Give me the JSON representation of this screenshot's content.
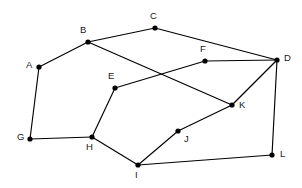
{
  "figure": {
    "kind": "undirected-graph-diagram",
    "background_color": "#ffffff",
    "edge_color": "#000000",
    "vertex_color": "#000000",
    "label_color": "#1a1a1a",
    "vertex_radius": 2.6,
    "edge_width": 1.15,
    "width": 302,
    "height": 188
  },
  "graph": {
    "vertex_count": 12,
    "edge_count": 15,
    "vertices": [
      {
        "id": "A",
        "label": "A",
        "x": 39,
        "y": 67,
        "label_x": 26,
        "label_y": 60
      },
      {
        "id": "B",
        "label": "B",
        "x": 88,
        "y": 42,
        "label_x": 80,
        "label_y": 25
      },
      {
        "id": "C",
        "label": "C",
        "x": 155,
        "y": 28,
        "label_x": 150,
        "label_y": 11
      },
      {
        "id": "D",
        "label": "D",
        "x": 277,
        "y": 60,
        "label_x": 284,
        "label_y": 53
      },
      {
        "id": "E",
        "label": "E",
        "x": 115,
        "y": 88,
        "label_x": 108,
        "label_y": 71
      },
      {
        "id": "F",
        "label": "F",
        "x": 205,
        "y": 61,
        "label_x": 200,
        "label_y": 44
      },
      {
        "id": "G",
        "label": "G",
        "x": 30,
        "y": 139,
        "label_x": 17,
        "label_y": 132
      },
      {
        "id": "H",
        "label": "H",
        "x": 92,
        "y": 137,
        "label_x": 86,
        "label_y": 142
      },
      {
        "id": "I",
        "label": "I",
        "x": 138,
        "y": 165,
        "label_x": 135,
        "label_y": 170
      },
      {
        "id": "J",
        "label": "J",
        "x": 178,
        "y": 131,
        "label_x": 184,
        "label_y": 134
      },
      {
        "id": "K",
        "label": "K",
        "x": 232,
        "y": 105,
        "label_x": 239,
        "label_y": 100
      },
      {
        "id": "L",
        "label": "L",
        "x": 272,
        "y": 155,
        "label_x": 280,
        "label_y": 149
      }
    ],
    "edges": [
      {
        "from": "A",
        "to": "B"
      },
      {
        "from": "A",
        "to": "G"
      },
      {
        "from": "B",
        "to": "C"
      },
      {
        "from": "B",
        "to": "K"
      },
      {
        "from": "C",
        "to": "D"
      },
      {
        "from": "D",
        "to": "F"
      },
      {
        "from": "D",
        "to": "K"
      },
      {
        "from": "D",
        "to": "L"
      },
      {
        "from": "E",
        "to": "F"
      },
      {
        "from": "E",
        "to": "H"
      },
      {
        "from": "G",
        "to": "H"
      },
      {
        "from": "H",
        "to": "I"
      },
      {
        "from": "I",
        "to": "J"
      },
      {
        "from": "I",
        "to": "L"
      },
      {
        "from": "J",
        "to": "K"
      }
    ]
  }
}
